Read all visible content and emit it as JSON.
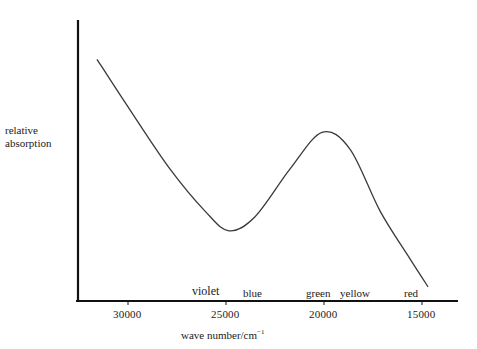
{
  "chart_data": {
    "type": "line",
    "title": "",
    "xlabel": "wave number/cm⁻¹",
    "ylabel": "relative absorption",
    "x_axis_reversed": true,
    "xlim": [
      31600,
      13200
    ],
    "ylim": [
      0,
      100
    ],
    "x_ticks": [
      30000,
      25000,
      20000,
      15000
    ],
    "x_tick_labels": [
      "30000",
      "25000",
      "20000",
      "15000"
    ],
    "y_ticks": [],
    "grid": false,
    "legend": null,
    "color_band_labels": [
      {
        "label": "violet",
        "wave_number": 25800
      },
      {
        "label": "blue",
        "wave_number": 23700
      },
      {
        "label": "green",
        "wave_number": 20300
      },
      {
        "label": "yellow",
        "wave_number": 18200
      },
      {
        "label": "red",
        "wave_number": 15600
      }
    ],
    "series": [
      {
        "name": "absorption spectrum",
        "x": [
          31580,
          29900,
          27860,
          26070,
          24850,
          23520,
          21730,
          20100,
          18670,
          17140,
          15610,
          14690
        ],
        "y": [
          86,
          68,
          47,
          32,
          25,
          30,
          47,
          60,
          54,
          32,
          15,
          5
        ]
      }
    ],
    "annotations": [
      "minimum near 25000 cm⁻¹ (violet/blue)",
      "maximum near 20000 cm⁻¹ (green)"
    ]
  },
  "axes": {
    "y_label_line1": "relative",
    "y_label_line2": "absorption",
    "x_label_main": "wave number/cm",
    "x_label_sup": "−1"
  },
  "ticks": [
    "30000",
    "25000",
    "20000",
    "15000"
  ],
  "bands": {
    "violet": "violet",
    "blue": "blue",
    "green": "green",
    "yellow": "yellow",
    "red": "red"
  },
  "colors": {
    "axis": "#111111",
    "curve": "#3a3a3a",
    "text": "#1a1a1a"
  }
}
